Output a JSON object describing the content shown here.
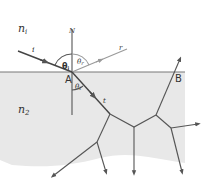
{
  "diagram": {
    "media": {
      "upper": {
        "label": "n",
        "subscript": "i"
      },
      "lower": {
        "label": "n",
        "subscript": "2"
      }
    },
    "normal_label": "N",
    "points": {
      "A": "A",
      "B": "B"
    },
    "rays": {
      "incident": "i",
      "reflected": "r",
      "transmitted": "t"
    },
    "angles": {
      "incident": {
        "symbol": "θ",
        "subscript": "i"
      },
      "reflected": {
        "symbol": "θ",
        "subscript": "r"
      },
      "transmitted": {
        "symbol": "θ",
        "subscript": "t"
      }
    },
    "colors": {
      "lower_medium_fill": "#e8e8e8",
      "interface_line": "#777777",
      "rays": "#555555",
      "reflected_ray": "#9a9a9a"
    }
  }
}
